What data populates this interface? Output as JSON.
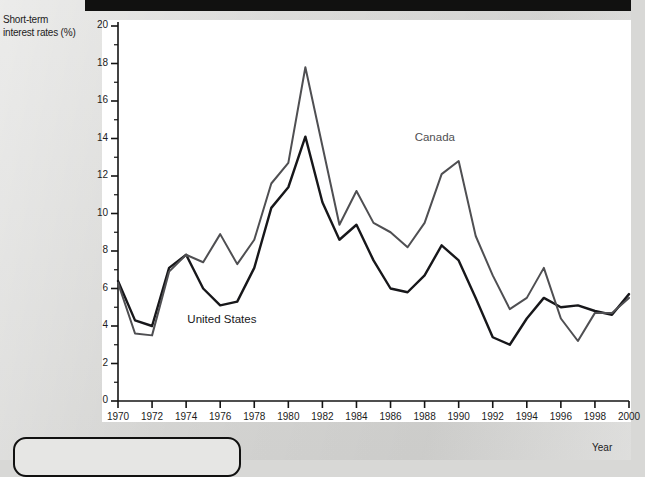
{
  "axes": {
    "y_title": "Short-term\ninterest rates (%)",
    "y_title_line1": "Short-term",
    "y_title_line2": "interest rates (%)",
    "x_title": "Year"
  },
  "series_labels": {
    "united_states": "United States",
    "canada": "Canada"
  },
  "colors": {
    "united_states_line": "#17171a",
    "canada_line": "#4f4f52",
    "axis": "#141414",
    "plot_background": "#ffffff",
    "page_background": "#d8d8d6",
    "top_bar": "#111110",
    "text": "#1c1c1c"
  },
  "chart_data": {
    "type": "line",
    "title": "",
    "subtitle": "",
    "xlabel": "Year",
    "ylabel": "Short-term interest rates (%)",
    "xlim": [
      1970,
      2000
    ],
    "ylim": [
      0,
      20
    ],
    "grid": false,
    "legend": "inline-annotations",
    "y_ticks": [
      0,
      2,
      4,
      6,
      8,
      10,
      12,
      14,
      16,
      18,
      20
    ],
    "y_minor_tick_step": 1,
    "x_ticks": [
      1970,
      1972,
      1974,
      1976,
      1978,
      1980,
      1982,
      1984,
      1986,
      1988,
      1990,
      1992,
      1994,
      1996,
      1998,
      2000
    ],
    "x_tick_labels": [
      "1970",
      "1972",
      "1974",
      "1976",
      "1978",
      "1980",
      "1982",
      "1984",
      "1986",
      "1988",
      "1990",
      "1992",
      "1994",
      "1996",
      "1998",
      "2000"
    ],
    "x": [
      1970,
      1971,
      1972,
      1973,
      1974,
      1975,
      1976,
      1977,
      1978,
      1979,
      1980,
      1981,
      1982,
      1983,
      1984,
      1985,
      1986,
      1987,
      1988,
      1989,
      1990,
      1991,
      1992,
      1993,
      1994,
      1995,
      1996,
      1997,
      1998,
      1999,
      2000
    ],
    "series": [
      {
        "name": "United States",
        "color": "#17171a",
        "label_x": 1976.1,
        "label_y": 4.25,
        "values": [
          6.4,
          4.3,
          4.0,
          7.1,
          7.8,
          6.0,
          5.1,
          5.3,
          7.1,
          10.3,
          11.4,
          14.1,
          10.6,
          8.6,
          9.4,
          7.5,
          6.0,
          5.8,
          6.7,
          8.3,
          7.5,
          5.5,
          3.4,
          3.0,
          4.4,
          5.5,
          5.0,
          5.1,
          4.8,
          4.6,
          5.7
        ]
      },
      {
        "name": "Canada",
        "color": "#4f4f52",
        "label_x": 1988.6,
        "label_y": 14.0,
        "values": [
          6.3,
          3.6,
          3.5,
          6.9,
          7.8,
          7.4,
          8.9,
          7.3,
          8.6,
          11.6,
          12.7,
          17.8,
          13.6,
          9.4,
          11.2,
          9.5,
          9.0,
          8.2,
          9.5,
          12.1,
          12.8,
          8.8,
          6.7,
          4.9,
          5.5,
          7.1,
          4.4,
          3.2,
          4.7,
          4.7,
          5.5
        ]
      }
    ]
  }
}
